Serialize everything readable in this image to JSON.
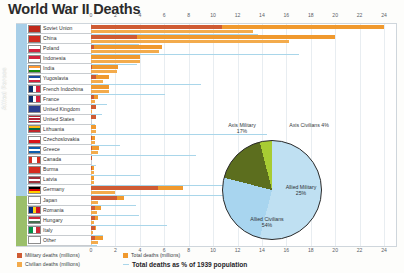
{
  "title": "World War II Deaths",
  "sides": {
    "allied": "Allied Forces",
    "axis": "Axis"
  },
  "axis": {
    "ticks": [
      "0",
      "2",
      "4",
      "6",
      "8",
      "10",
      "12",
      "14",
      "16",
      "18",
      "20",
      "22",
      "24"
    ],
    "min": 0,
    "max": 24
  },
  "legend": {
    "military": "Military deaths (millions)",
    "total": "Total deaths (millions)",
    "civilian": "Civilian deaths (millions)",
    "percent": "Total deaths as % of 1939 population"
  },
  "colors": {
    "military": "#cf5b33",
    "total": "#f0992e",
    "civilian": "#f3ab4c",
    "percent": "#a9d6ea",
    "allied_band": "#a8cfe8",
    "axis_band": "#9bbf6a",
    "pie_allied_civilians": "#bfe0f2",
    "pie_allied_military": "#a8d5ef",
    "pie_axis_military": "#5c6e1e",
    "pie_axis_civilians": "#a8cc33"
  },
  "chart_data": {
    "type": "bar",
    "title": "World War II Deaths",
    "xlabel": "",
    "ylabel": "",
    "xlim": [
      0,
      24
    ],
    "grid": true,
    "orientation": "horizontal",
    "categories": [
      "Soviet Union",
      "China",
      "Poland",
      "Indonesia",
      "India",
      "Yugoslavia",
      "French Indochina",
      "France",
      "United Kingdom",
      "United States",
      "Lithuania",
      "Czechoslovakia",
      "Greece",
      "Canada",
      "Burma",
      "Latvia",
      "Germany",
      "Japan",
      "Romania",
      "Hungary",
      "Italy",
      "Other"
    ],
    "sides": [
      "Allied",
      "Allied",
      "Allied",
      "Allied",
      "Allied",
      "Allied",
      "Allied",
      "Allied",
      "Allied",
      "Allied",
      "Allied",
      "Allied",
      "Allied",
      "Allied",
      "Allied",
      "Allied",
      "Axis",
      "Axis",
      "Axis",
      "Axis",
      "Axis",
      "Axis"
    ],
    "series": [
      {
        "name": "Military deaths (millions)",
        "values": [
          10.7,
          3.8,
          0.24,
          0.0,
          0.087,
          0.45,
          0.0,
          0.21,
          0.38,
          0.42,
          0.0,
          0.025,
          0.02,
          0.045,
          0.022,
          0.0,
          5.5,
          2.1,
          0.3,
          0.3,
          0.3,
          0.35
        ]
      },
      {
        "name": "Civilian deaths (millions)",
        "values": [
          13.3,
          16.2,
          5.6,
          4.0,
          2.1,
          1.0,
          1.5,
          0.35,
          0.07,
          0.0,
          0.37,
          0.32,
          0.6,
          0.0,
          0.25,
          0.23,
          2.0,
          0.58,
          0.5,
          0.28,
          0.15,
          0.6
        ]
      },
      {
        "name": "Total deaths (millions)",
        "values": [
          24.0,
          20.0,
          5.82,
          4.0,
          2.2,
          1.45,
          1.5,
          0.57,
          0.45,
          0.42,
          0.37,
          0.345,
          0.62,
          0.045,
          0.27,
          0.23,
          7.5,
          2.7,
          0.8,
          0.58,
          0.45,
          0.95
        ]
      },
      {
        "name": "Total deaths as % of 1939 population",
        "values": [
          13.7,
          3.9,
          17.0,
          3.8,
          0.6,
          9.0,
          6.1,
          1.35,
          0.94,
          0.32,
          14.4,
          2.4,
          8.6,
          0.4,
          4.0,
          12.5,
          10.8,
          3.7,
          3.9,
          6.2,
          1.0,
          0.5
        ]
      }
    ]
  },
  "pie": {
    "type": "pie",
    "title": "",
    "slices": [
      {
        "label": "Allied Civilians",
        "value": 54,
        "pct_text": "54%",
        "color": "#bfe0f2"
      },
      {
        "label": "Allied Military",
        "value": 25,
        "pct_text": "25%",
        "color": "#a8d5ef"
      },
      {
        "label": "Axis Military",
        "value": 17,
        "pct_text": "17%",
        "color": "#5c6e1e"
      },
      {
        "label": "Axis Civilians",
        "value": 4,
        "pct_text": "4%",
        "color": "#a8cc33"
      }
    ],
    "labels": {
      "axis_military": "Axis Military",
      "axis_military_pct": "17%",
      "axis_civilians": "Axis Civilians 4%",
      "allied_military": "Allied Military",
      "allied_military_pct": "25%",
      "allied_civilians": "Allied Civilians",
      "allied_civilians_pct": "54%"
    }
  }
}
